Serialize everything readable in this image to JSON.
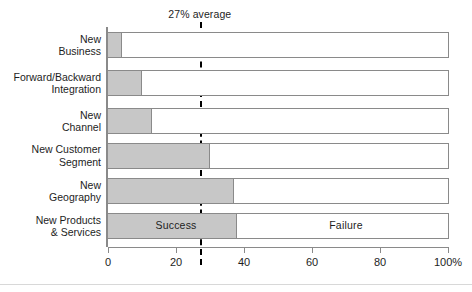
{
  "chart_data": {
    "type": "bar",
    "orientation": "horizontal",
    "stacked": true,
    "percent": true,
    "title": "",
    "subtitle": "",
    "xlabel": "",
    "ylabel": "",
    "xlim": [
      0,
      100
    ],
    "xticks": [
      0,
      20,
      40,
      60,
      80,
      100
    ],
    "xtick_labels": [
      "0",
      "20",
      "40",
      "60",
      "80",
      "100%"
    ],
    "grid": false,
    "legend_position": "in-bar",
    "categories": [
      "New\nBusiness",
      "Forward/Backward\nIntegration",
      "New\nChannel",
      "New Customer\nSegment",
      "New\nGeography",
      "New Products\n& Services"
    ],
    "series": [
      {
        "name": "Success",
        "color": "#c7c7c7",
        "values": [
          4,
          10,
          13,
          30,
          37,
          38
        ]
      },
      {
        "name": "Failure",
        "color": "#ffffff",
        "values": [
          96,
          90,
          87,
          70,
          63,
          62
        ]
      }
    ],
    "annotations": [
      {
        "name": "average-line",
        "label": "27% average",
        "value": 27,
        "style": "vertical dashed line"
      }
    ],
    "in_bar_labels": [
      {
        "text": "Success",
        "at_percent": 20,
        "row": 5
      },
      {
        "text": "Failure",
        "at_percent": 70,
        "row": 5
      }
    ]
  },
  "colors": {
    "success_fill": "#c7c7c7",
    "failure_fill": "#ffffff",
    "bar_border": "#8a8a8a",
    "axis": "#8a8a8a",
    "text": "#1d1d1d",
    "average_line": "#000000"
  }
}
